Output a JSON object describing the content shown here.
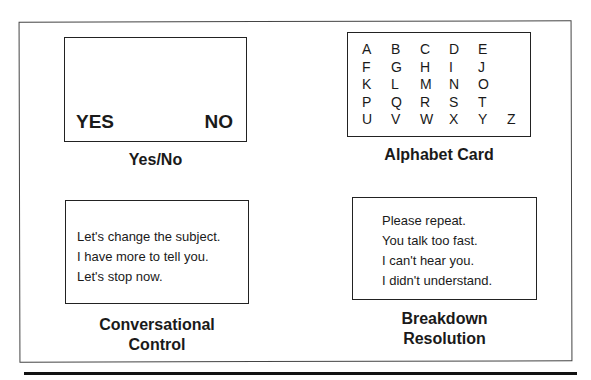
{
  "cards": [
    {
      "title": "Yes/No",
      "yes": "YES",
      "no": "NO"
    },
    {
      "title": "Alphabet Card",
      "letters": [
        "A",
        "B",
        "C",
        "D",
        "E",
        "",
        "F",
        "G",
        "H",
        "I",
        "J",
        "",
        "K",
        "L",
        "M",
        "N",
        "O",
        "",
        "P",
        "Q",
        "R",
        "S",
        "T",
        "",
        "U",
        "V",
        "W",
        "X",
        "Y",
        "Z"
      ]
    },
    {
      "title_line1": "Conversational",
      "title_line2": "Control",
      "lines": [
        "Let's change the subject.",
        "I have more to tell you.",
        "Let's stop now."
      ]
    },
    {
      "title_line1": "Breakdown",
      "title_line2": "Resolution",
      "lines": [
        "Please repeat.",
        "You talk too fast.",
        "I can't hear you.",
        "I didn't understand."
      ]
    }
  ]
}
